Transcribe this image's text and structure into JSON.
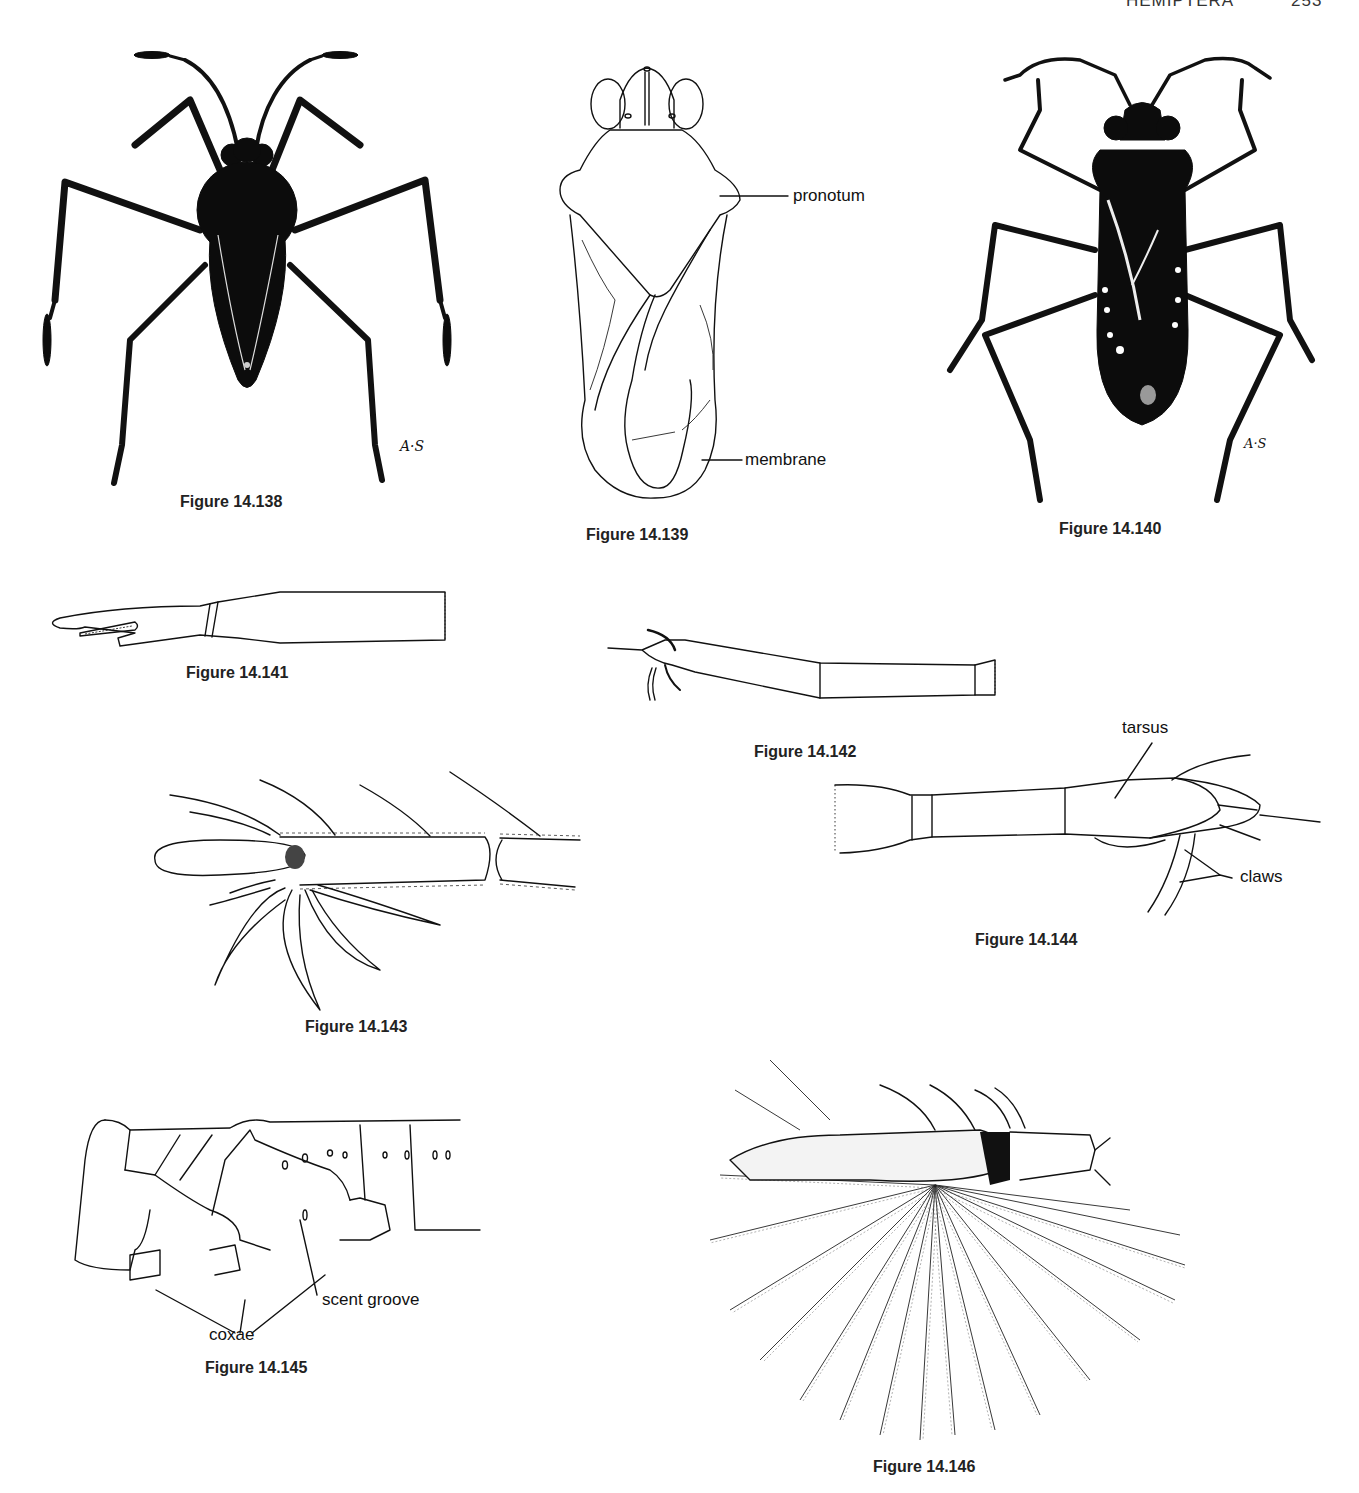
{
  "page_header": {
    "title": "HEMIPTERA",
    "page_number": "253"
  },
  "figures": [
    {
      "id": "fig-14-138",
      "caption": "Figure 14.138",
      "signature": "A·S",
      "subject": "dark-bodied bug, dorsal view"
    },
    {
      "id": "fig-14-139",
      "caption": "Figure 14.139",
      "labels": [
        "pronotum",
        "membrane"
      ],
      "subject": "bug outline, dorsal view"
    },
    {
      "id": "fig-14-140",
      "caption": "Figure 14.140",
      "signature": "A·S",
      "subject": "dark bug with pale spots, dorsal view"
    },
    {
      "id": "fig-14-141",
      "caption": "Figure 14.141",
      "subject": "leg segment with cleft tip"
    },
    {
      "id": "fig-14-142",
      "caption": "Figure 14.142",
      "subject": "tarsus with claws"
    },
    {
      "id": "fig-14-143",
      "caption": "Figure 14.143",
      "subject": "tarsus with fan of leaf-like blades"
    },
    {
      "id": "fig-14-144",
      "caption": "Figure 14.144",
      "labels": [
        "tarsus",
        "claws"
      ],
      "subject": "tarsus and claws"
    },
    {
      "id": "fig-14-145",
      "caption": "Figure 14.145",
      "labels": [
        "scent groove",
        "coxae"
      ],
      "subject": "thorax, lateral view"
    },
    {
      "id": "fig-14-146",
      "caption": "Figure 14.146",
      "subject": "tarsus with feathery swimming fan"
    }
  ]
}
